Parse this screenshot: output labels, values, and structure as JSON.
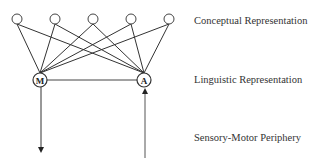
{
  "diagram": {
    "layers": [
      {
        "name": "Conceptual Representation",
        "y": 20
      },
      {
        "name": "Linguistic Representation",
        "y": 79
      },
      {
        "name": "Sensory-Motor Periphery",
        "y": 137
      }
    ],
    "conceptual_nodes": [
      {
        "x": 17,
        "y": 19
      },
      {
        "x": 55,
        "y": 19
      },
      {
        "x": 93,
        "y": 19
      },
      {
        "x": 131,
        "y": 19
      },
      {
        "x": 169,
        "y": 19
      }
    ],
    "linguistic_nodes": [
      {
        "id": "M",
        "label": "M",
        "x": 40,
        "y": 80
      },
      {
        "id": "A",
        "label": "A",
        "x": 144,
        "y": 80
      }
    ],
    "edges": "every conceptual node connects to both M and A; M connects to A",
    "arrows": [
      {
        "from": "M",
        "direction": "down",
        "to": "Sensory-Motor Periphery"
      },
      {
        "from": "Sensory-Motor Periphery",
        "direction": "up",
        "to": "A"
      }
    ],
    "colors": {
      "line": "#333333",
      "text": "#333333",
      "background": "#ffffff"
    }
  }
}
